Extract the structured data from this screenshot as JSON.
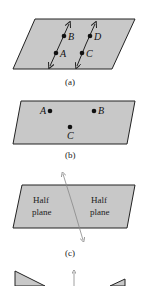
{
  "colors": {
    "plane_fill": "#c8c8c8",
    "stroke": "#222222",
    "line": "#333333",
    "thin_line": "#888888"
  },
  "panels": [
    {
      "caption": "(a)",
      "points": [
        "A",
        "B",
        "C",
        "D"
      ]
    },
    {
      "caption": "(b)",
      "points": [
        "A",
        "B",
        "C"
      ]
    },
    {
      "caption": "(c)",
      "regions": [
        "Half plane",
        "Half plane"
      ],
      "region_left": {
        "line1": "Half",
        "line2": "plane"
      },
      "region_right": {
        "line1": "Half",
        "line2": "plane"
      }
    },
    {
      "caption": ""
    }
  ]
}
